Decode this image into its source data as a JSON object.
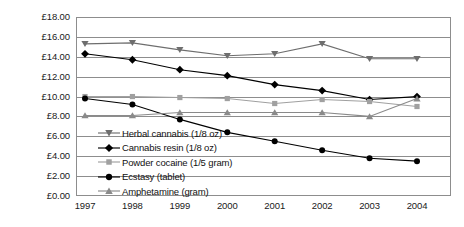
{
  "chart_data": {
    "type": "line",
    "title": "",
    "xlabel": "",
    "ylabel": "",
    "categories": [
      "1997",
      "1998",
      "1999",
      "2000",
      "2001",
      "2002",
      "2003",
      "2004"
    ],
    "x": [
      1997,
      1998,
      1999,
      2000,
      2001,
      2002,
      2003,
      2004
    ],
    "ylim": [
      0,
      18
    ],
    "ytick_step": 2,
    "ytick_labels": [
      "£18.00",
      "£16.00",
      "£14.00",
      "£12.00",
      "£10.00",
      "£8.00",
      "£6.00",
      "£4.00",
      "£2.00",
      "£0.00"
    ],
    "ytick_values": [
      18,
      16,
      14,
      12,
      10,
      8,
      6,
      4,
      2,
      0
    ],
    "currency": "£",
    "grid": true,
    "grid_axis": "y",
    "legend_position": "inside-lower-left",
    "series": [
      {
        "name": "Herbal cannabis (1/8 oz)",
        "marker": "triangle-down",
        "color": "#6e6e6e",
        "values": [
          15.3,
          15.4,
          14.7,
          14.1,
          14.3,
          15.3,
          13.8,
          13.8
        ]
      },
      {
        "name": "Cannabis resin (1/8 oz)",
        "marker": "diamond",
        "color": "#000000",
        "values": [
          14.3,
          13.7,
          12.7,
          12.1,
          11.2,
          10.6,
          9.7,
          10.0
        ]
      },
      {
        "name": "Powder cocaine (1/5 gram)",
        "marker": "square",
        "color": "#a0a0a0",
        "values": [
          10.0,
          10.0,
          9.9,
          9.8,
          9.3,
          9.7,
          9.5,
          9.0
        ]
      },
      {
        "name": "Ecstasy (tablet)",
        "marker": "circle",
        "color": "#000000",
        "values": [
          9.8,
          9.2,
          7.7,
          6.4,
          5.5,
          4.6,
          3.8,
          3.5
        ]
      },
      {
        "name": "Amphetamine (gram)",
        "marker": "triangle-up",
        "color": "#8a8a8a",
        "values": [
          8.1,
          8.1,
          8.4,
          8.4,
          8.4,
          8.4,
          8.0,
          9.8
        ]
      }
    ]
  },
  "legend": {
    "items": [
      {
        "label": "Herbal cannabis (1/8 oz)",
        "icon": "triangle-down-marker-icon"
      },
      {
        "label": "Cannabis resin (1/8 oz)",
        "icon": "diamond-marker-icon"
      },
      {
        "label": "Powder cocaine (1/5 gram)",
        "icon": "square-marker-icon"
      },
      {
        "label": "Ecstasy (tablet)",
        "icon": "circle-marker-icon"
      },
      {
        "label": "Amphetamine (gram)",
        "icon": "triangle-up-marker-icon"
      }
    ]
  }
}
